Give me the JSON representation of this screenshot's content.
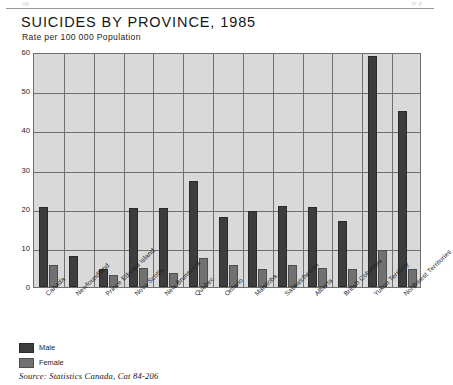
{
  "page_artifact": {
    "ghost_left": "ug",
    "ghost_right": "ty  g"
  },
  "header": {
    "title": "SUICIDES BY PROVINCE, 1985",
    "subtitle": "Rate per 100 000 Population"
  },
  "legend": {
    "items": [
      {
        "label": "Male",
        "color": "#3d3d3d"
      },
      {
        "label": "Female",
        "color": "#717171"
      }
    ]
  },
  "source": {
    "text": "Source: Statistics Canada, Cat 84-206"
  },
  "chart_data": {
    "type": "bar",
    "title": "SUICIDES BY PROVINCE, 1985",
    "subtitle": "Rate per 100 000 Population",
    "xlabel": "",
    "ylabel": "Rate per 100 000 Population",
    "ylim": [
      0,
      60
    ],
    "yticks": [
      0,
      10,
      20,
      30,
      40,
      50,
      60
    ],
    "grid": true,
    "legend_position": "below-left",
    "categories": [
      "Canada",
      "Newfoundland",
      "Prince Edward Island",
      "Nova Scotia",
      "New Brunswick",
      "Quebec",
      "Ontario",
      "Manitoba",
      "Saskatchewan",
      "Alberta",
      "British Columbia",
      "Yukon Territory",
      "Northwest Territories"
    ],
    "series": [
      {
        "name": "Male",
        "color": "#3d3d3d",
        "values": [
          20.5,
          8.0,
          4.5,
          20.3,
          20.3,
          27.0,
          17.8,
          19.5,
          20.6,
          20.5,
          16.8,
          59.0,
          45.0
        ]
      },
      {
        "name": "Female",
        "color": "#717171",
        "values": [
          5.5,
          0.0,
          3.0,
          4.8,
          3.5,
          7.3,
          5.5,
          4.5,
          5.5,
          4.8,
          4.5,
          9.5,
          4.5
        ]
      }
    ]
  }
}
